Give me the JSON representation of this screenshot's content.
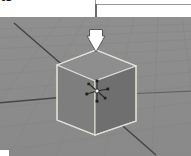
{
  "image": {
    "width": 191,
    "height": 156,
    "kind": "3d-viewport-screenshot-with-annotation"
  },
  "caption": {
    "clipped_text": "3D"
  },
  "annotation": {
    "callout_label": "",
    "arrow_direction": "down",
    "arrow_fill_color": "#ffffff",
    "arrow_outline_color": "#5a5a5a",
    "leader_color": "#6b6b6b",
    "callout_border_color": "#9a9a9a",
    "target": "cube"
  },
  "viewport": {
    "name": "3D Viewport",
    "background_color": "#8b8b8b",
    "grid_color": "#7e7e7e",
    "grid_visible": true,
    "axes": [
      {
        "name": "x-axis-line",
        "color": "#4a4a4a"
      },
      {
        "name": "y-axis-line",
        "color": "#4a4a4a"
      }
    ]
  },
  "object": {
    "name": "Cube",
    "selected": true,
    "outline_color": "#d8d8d0",
    "face_top_color": "#8e8e8e",
    "face_front_color": "#6f6f6f",
    "face_left_color": "#828282"
  },
  "gizmo": {
    "name": "transform-manipulator",
    "type": "translate",
    "color": "#2e2e2e",
    "origin_color": "#f2f2f2"
  }
}
